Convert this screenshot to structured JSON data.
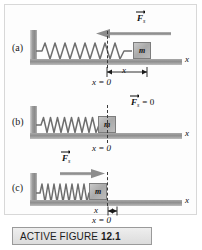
{
  "figure": {
    "caption_prefix": "ACTIVE FIGURE",
    "caption_number": "12.1",
    "axis_label": "x",
    "equilibrium_label": "x = 0",
    "displacement_label": "x",
    "mass_label": "m",
    "force_symbol": "F",
    "force_subscript": "s",
    "force_zero_label": "= 0"
  },
  "panels": [
    {
      "id": "a",
      "label": "(a)",
      "state": "stretched",
      "spring_state": "stretched",
      "force_direction": "left",
      "force_text": "F",
      "force_sub": "s",
      "force_suffix": "",
      "block_label": "m",
      "axis_label": "x",
      "equilibrium_label": "x = 0",
      "displacement_label": "x",
      "show_displacement": true,
      "show_force_arrow": true
    },
    {
      "id": "b",
      "label": "(b)",
      "state": "equilibrium",
      "spring_state": "natural",
      "force_direction": "none",
      "force_text": "F",
      "force_sub": "s",
      "force_suffix": "= 0",
      "block_label": "m",
      "axis_label": "x",
      "equilibrium_label": "x = 0",
      "displacement_label": "",
      "show_displacement": false,
      "show_force_arrow": false
    },
    {
      "id": "c",
      "label": "(c)",
      "state": "compressed",
      "spring_state": "compressed",
      "force_direction": "right",
      "force_text": "F",
      "force_sub": "s",
      "force_suffix": "",
      "block_label": "m",
      "axis_label": "x",
      "equilibrium_label": "x = 0",
      "displacement_label": "x",
      "show_displacement": true,
      "show_force_arrow": true
    }
  ],
  "colors": {
    "ground": "#8e8e8e",
    "wall": "#9b9b9b",
    "block": "#a9a9a9",
    "spring": "#6e6e6e",
    "arrow": "#8d8d8d",
    "dashline": "#3a3a3a",
    "caption_bg": "#e5e5e5",
    "frame": "#d8d8d8"
  }
}
